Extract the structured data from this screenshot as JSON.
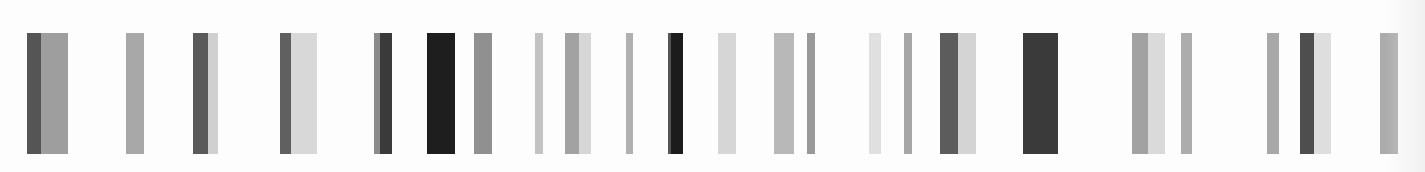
{
  "image": {
    "description": "Grayscale vertical bar pattern (barcode-like) on white background",
    "width": 1425,
    "height": 172,
    "background": "#fdfdfd",
    "bar_top": 33,
    "bar_bottom": 154
  },
  "palette": {
    "black": "#1e1e1e",
    "very_dark": "#3c3c3c",
    "dark": "#555555",
    "dark_mid": "#6a6a6a",
    "mid": "#999999",
    "light_mid": "#b3b3b3",
    "light": "#d2d2d2",
    "very_light": "#e3e3e3"
  },
  "bars": [
    {
      "x": 27,
      "segments": [
        {
          "w": 14,
          "color": "#555555"
        },
        {
          "w": 27,
          "color": "#9e9e9e"
        }
      ]
    },
    {
      "x": 126,
      "segments": [
        {
          "w": 18,
          "color": "#a8a8a8"
        }
      ]
    },
    {
      "x": 193,
      "segments": [
        {
          "w": 15,
          "color": "#5a5a5a"
        },
        {
          "w": 10,
          "color": "#d0d0d0"
        }
      ]
    },
    {
      "x": 280,
      "segments": [
        {
          "w": 11,
          "color": "#606060"
        },
        {
          "w": 26,
          "color": "#d8d8d8"
        }
      ]
    },
    {
      "x": 374,
      "segments": [
        {
          "w": 6,
          "color": "#8c8c8c"
        },
        {
          "w": 12,
          "color": "#3a3a3a"
        }
      ]
    },
    {
      "x": 427,
      "segments": [
        {
          "w": 28,
          "color": "#1e1e1e"
        }
      ]
    },
    {
      "x": 474,
      "segments": [
        {
          "w": 18,
          "color": "#909090"
        }
      ]
    },
    {
      "x": 535,
      "segments": [
        {
          "w": 8,
          "color": "#c2c2c2"
        }
      ]
    },
    {
      "x": 565,
      "segments": [
        {
          "w": 14,
          "color": "#a2a2a2"
        },
        {
          "w": 12,
          "color": "#d6d6d6"
        }
      ]
    },
    {
      "x": 626,
      "segments": [
        {
          "w": 7,
          "color": "#b0b0b0"
        }
      ]
    },
    {
      "x": 668,
      "segments": [
        {
          "w": 3,
          "color": "#555555"
        },
        {
          "w": 12,
          "color": "#1c1c1c"
        }
      ]
    },
    {
      "x": 718,
      "segments": [
        {
          "w": 18,
          "color": "#d6d6d6"
        }
      ]
    },
    {
      "x": 774,
      "segments": [
        {
          "w": 20,
          "color": "#b8b8b8"
        }
      ]
    },
    {
      "x": 807,
      "segments": [
        {
          "w": 8,
          "color": "#999999"
        }
      ]
    },
    {
      "x": 869,
      "segments": [
        {
          "w": 12,
          "color": "#e0e0e0"
        }
      ]
    },
    {
      "x": 904,
      "segments": [
        {
          "w": 8,
          "color": "#a6a6a6"
        }
      ]
    },
    {
      "x": 940,
      "segments": [
        {
          "w": 18,
          "color": "#5c5c5c"
        },
        {
          "w": 18,
          "color": "#d4d4d4"
        }
      ]
    },
    {
      "x": 1023,
      "segments": [
        {
          "w": 35,
          "color": "#3a3a3a"
        }
      ]
    },
    {
      "x": 1132,
      "segments": [
        {
          "w": 16,
          "color": "#a2a2a2"
        },
        {
          "w": 17,
          "color": "#dadada"
        }
      ]
    },
    {
      "x": 1181,
      "segments": [
        {
          "w": 11,
          "color": "#acacac"
        }
      ]
    },
    {
      "x": 1267,
      "segments": [
        {
          "w": 12,
          "color": "#a8a8a8"
        }
      ]
    },
    {
      "x": 1300,
      "segments": [
        {
          "w": 14,
          "color": "#4e4e4e"
        },
        {
          "w": 17,
          "color": "#dedede"
        }
      ]
    },
    {
      "x": 1380,
      "segments": [
        {
          "w": 18,
          "color": "#ababab"
        }
      ]
    }
  ]
}
